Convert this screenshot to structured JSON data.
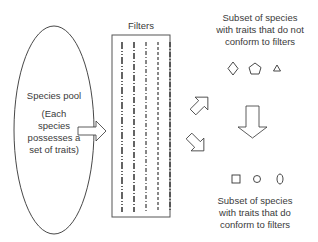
{
  "pool": {
    "title": "Species pool",
    "note_line1": "(Each",
    "note_line2": "species",
    "note_line3": "possesses a",
    "note_line4": "set of traits)"
  },
  "filters": {
    "label": "Filters",
    "line_count": 5
  },
  "nonconform": {
    "line1": "Subset of species",
    "line2": "with traits that do not",
    "line3": "conform to filters",
    "shapes": [
      "diamond",
      "pentagon",
      "triangle"
    ]
  },
  "conform": {
    "line1": "Subset of species",
    "line2": "with traits that do",
    "line3": "conform to filters",
    "shapes": [
      "square",
      "circle",
      "oval"
    ]
  },
  "colors": {
    "stroke": "#333333",
    "text": "#3a3a3a"
  }
}
